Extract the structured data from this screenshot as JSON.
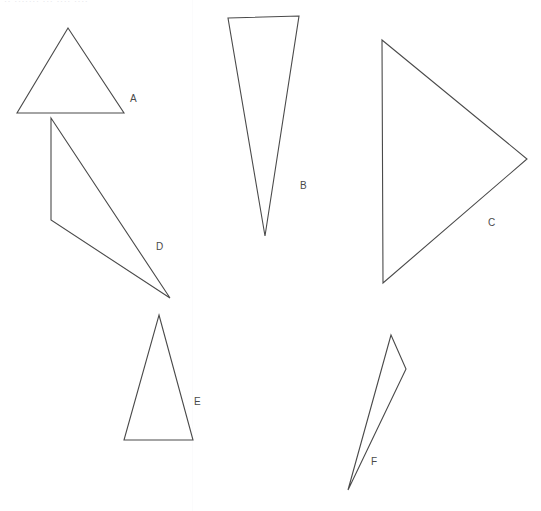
{
  "page": {
    "width": 541,
    "height": 511,
    "background_color": "#ffffff",
    "stroke_color": "#4a4a4a",
    "label_color": "#4a4a4a",
    "header_cutoff_text": "·· ······· ··· ···· ····",
    "fold_line_x": 192,
    "fold_line_color": "#fbfbfc"
  },
  "shapes": [
    {
      "id": "triangle-a",
      "label": "A",
      "label_x": 130,
      "label_y": 94,
      "points": "68,28 124,113 17,113",
      "stroke": "#4a4a4a",
      "stroke_width": 1.1
    },
    {
      "id": "triangle-d",
      "label": "D",
      "label_x": 156,
      "label_y": 242,
      "points": "51,118 170,298 51,220",
      "stroke": "#4a4a4a",
      "stroke_width": 1.1
    },
    {
      "id": "triangle-b",
      "label": "B",
      "label_x": 300,
      "label_y": 181,
      "points": "228,18 299,16 265,236",
      "stroke": "#4a4a4a",
      "stroke_width": 1.1
    },
    {
      "id": "triangle-c",
      "label": "C",
      "label_x": 488,
      "label_y": 218,
      "points": "382,40 527,159 383,283",
      "stroke": "#4a4a4a",
      "stroke_width": 1.1
    },
    {
      "id": "triangle-e",
      "label": "E",
      "label_x": 194,
      "label_y": 397,
      "points": "159,315 193,440 124,440",
      "stroke": "#4a4a4a",
      "stroke_width": 1.1
    },
    {
      "id": "triangle-f",
      "label": "F",
      "label_x": 371,
      "label_y": 457,
      "points": "391,335 406,369 348,490",
      "stroke": "#4a4a4a",
      "stroke_width": 1.1
    }
  ]
}
